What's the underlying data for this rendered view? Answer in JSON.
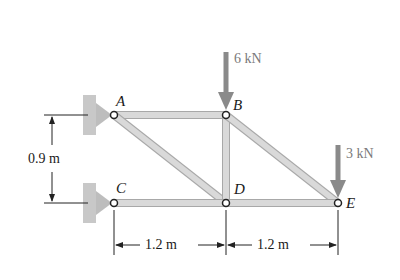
{
  "diagram": {
    "type": "planar truss",
    "joints": [
      {
        "id": "A",
        "label": "A",
        "x": 114,
        "y": 115,
        "support": "pin"
      },
      {
        "id": "B",
        "label": "B",
        "x": 226,
        "y": 115
      },
      {
        "id": "C",
        "label": "C",
        "x": 114,
        "y": 203,
        "support": "pin"
      },
      {
        "id": "D",
        "label": "D",
        "x": 226,
        "y": 203
      },
      {
        "id": "E",
        "label": "E",
        "x": 338,
        "y": 203
      }
    ],
    "members": [
      [
        "A",
        "B"
      ],
      [
        "A",
        "D"
      ],
      [
        "B",
        "D"
      ],
      [
        "B",
        "E"
      ],
      [
        "C",
        "D"
      ],
      [
        "D",
        "E"
      ]
    ],
    "loads": [
      {
        "joint": "B",
        "label": "6 kN",
        "direction": "down"
      },
      {
        "joint": "E",
        "label": "3 kN",
        "direction": "down"
      }
    ],
    "dimensions": {
      "vertical": {
        "label": "0.9 m",
        "between": [
          "A",
          "C"
        ]
      },
      "horizontal": [
        {
          "label": "1.2 m",
          "between": [
            "C",
            "D"
          ]
        },
        {
          "label": "1.2 m",
          "between": [
            "D",
            "E"
          ]
        }
      ]
    },
    "colors": {
      "member": "#d4d4d4",
      "member_edge": "#a8a8a8",
      "support": "#c8c8c8",
      "arrow": "#8a8a8a",
      "line": "#222222"
    }
  }
}
